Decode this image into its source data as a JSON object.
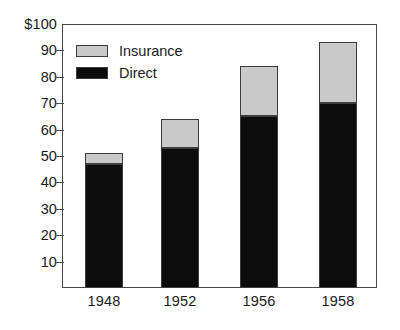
{
  "chart_data": {
    "type": "bar",
    "subtype": "stacked-bar",
    "title": "",
    "xlabel": "",
    "ylabel": "",
    "categories": [
      "1948",
      "1952",
      "1956",
      "1958"
    ],
    "series": [
      {
        "name": "Direct",
        "values": [
          47,
          53,
          65,
          70
        ],
        "color": "#0c0c0c"
      },
      {
        "name": "Insurance",
        "values": [
          4,
          11,
          19,
          23
        ],
        "color": "#c9c9c9"
      }
    ],
    "totals": [
      51,
      64,
      84,
      93
    ],
    "ylim": [
      0,
      100
    ],
    "ytick_values": [
      10,
      20,
      30,
      40,
      50,
      60,
      70,
      80,
      90,
      100
    ],
    "ytick_labels": [
      "10",
      "20",
      "30",
      "40",
      "50",
      "60",
      "70",
      "80",
      "90",
      "$100"
    ],
    "grid": false,
    "legend_position": "top-left",
    "legend_entries": [
      "Insurance",
      "Direct"
    ]
  }
}
